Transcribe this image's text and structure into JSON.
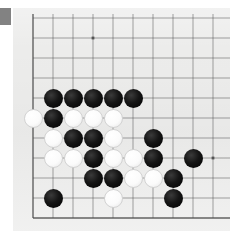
{
  "scene": {
    "title": "Go board corner position",
    "kind": "go-board",
    "background_color": "#ffffff",
    "board_color": "#ececeb",
    "line_color": "#4a4a4a",
    "black_color": "#000000",
    "white_color": "#ffffff",
    "corner_tab_color": "#828282"
  },
  "board": {
    "panel": {
      "x": 13,
      "y": 8,
      "width": 217,
      "height": 223
    },
    "origin": {
      "x": 33,
      "y": 18
    },
    "cell": 20,
    "cols": 10,
    "rows": 10,
    "left_edge_col": 0,
    "bottom_edge_row": 10,
    "star_points": [
      {
        "col": 3,
        "row": 1
      },
      {
        "col": 9,
        "row": 7
      }
    ],
    "stone_radius": 9.5
  },
  "chart_data": {
    "type": "table",
    "xlabel": "column (grid index from left board edge)",
    "ylabel": "row (grid index from top of view)",
    "legend": [
      "black stone",
      "white stone"
    ],
    "categories": [
      "col",
      "row",
      "color"
    ],
    "stones": [
      {
        "col": 1,
        "row": 4,
        "color": "black"
      },
      {
        "col": 2,
        "row": 4,
        "color": "black"
      },
      {
        "col": 3,
        "row": 4,
        "color": "black"
      },
      {
        "col": 4,
        "row": 4,
        "color": "black"
      },
      {
        "col": 5,
        "row": 4,
        "color": "black"
      },
      {
        "col": 0,
        "row": 5,
        "color": "white"
      },
      {
        "col": 1,
        "row": 5,
        "color": "black"
      },
      {
        "col": 2,
        "row": 5,
        "color": "white"
      },
      {
        "col": 3,
        "row": 5,
        "color": "white"
      },
      {
        "col": 4,
        "row": 5,
        "color": "white"
      },
      {
        "col": 1,
        "row": 6,
        "color": "white"
      },
      {
        "col": 2,
        "row": 6,
        "color": "black"
      },
      {
        "col": 3,
        "row": 6,
        "color": "black"
      },
      {
        "col": 4,
        "row": 6,
        "color": "white"
      },
      {
        "col": 6,
        "row": 6,
        "color": "black"
      },
      {
        "col": 1,
        "row": 7,
        "color": "white"
      },
      {
        "col": 2,
        "row": 7,
        "color": "white"
      },
      {
        "col": 3,
        "row": 7,
        "color": "black"
      },
      {
        "col": 4,
        "row": 7,
        "color": "white"
      },
      {
        "col": 5,
        "row": 7,
        "color": "white"
      },
      {
        "col": 6,
        "row": 7,
        "color": "black"
      },
      {
        "col": 8,
        "row": 7,
        "color": "black"
      },
      {
        "col": 3,
        "row": 8,
        "color": "black"
      },
      {
        "col": 4,
        "row": 8,
        "color": "black"
      },
      {
        "col": 5,
        "row": 8,
        "color": "white"
      },
      {
        "col": 6,
        "row": 8,
        "color": "white"
      },
      {
        "col": 7,
        "row": 8,
        "color": "black"
      },
      {
        "col": 1,
        "row": 9,
        "color": "black"
      },
      {
        "col": 4,
        "row": 9,
        "color": "white"
      },
      {
        "col": 7,
        "row": 9,
        "color": "black"
      }
    ],
    "counts": {
      "black": 18,
      "white": 12,
      "total": 30
    }
  }
}
